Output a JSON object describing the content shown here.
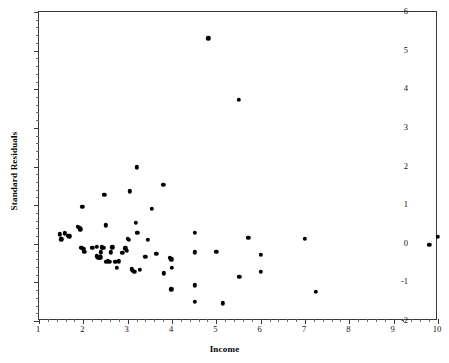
{
  "chart_data": {
    "type": "scatter",
    "title": "",
    "xlabel": "Income",
    "ylabel": "Standard Residuals",
    "xlim": [
      1,
      10
    ],
    "ylim": [
      -2,
      6
    ],
    "xticks": [
      1,
      2,
      3,
      4,
      5,
      6,
      7,
      8,
      9,
      10
    ],
    "yticks": [
      -2,
      -1,
      0,
      1,
      2,
      3,
      4,
      5,
      6
    ],
    "x_minor_step": 0.2,
    "y_minor_step": 0.2,
    "grid": false,
    "legend": null,
    "marker": "filled-circle",
    "marker_color": "#000000",
    "points": [
      {
        "x": 1.47,
        "y": 0.24
      },
      {
        "x": 1.5,
        "y": 0.12
      },
      {
        "x": 1.58,
        "y": 0.27
      },
      {
        "x": 1.65,
        "y": 0.2
      },
      {
        "x": 1.68,
        "y": 0.19
      },
      {
        "x": 1.88,
        "y": 0.44
      },
      {
        "x": 1.92,
        "y": 0.42
      },
      {
        "x": 1.93,
        "y": 0.37
      },
      {
        "x": 1.98,
        "y": 0.96
      },
      {
        "x": 1.95,
        "y": -0.1
      },
      {
        "x": 2.0,
        "y": -0.13
      },
      {
        "x": 2.02,
        "y": -0.21
      },
      {
        "x": 2.2,
        "y": -0.1
      },
      {
        "x": 2.3,
        "y": -0.08
      },
      {
        "x": 2.3,
        "y": -0.33
      },
      {
        "x": 2.33,
        "y": -0.36
      },
      {
        "x": 2.36,
        "y": -0.37
      },
      {
        "x": 2.38,
        "y": -0.35
      },
      {
        "x": 2.4,
        "y": -0.22
      },
      {
        "x": 2.42,
        "y": -0.09
      },
      {
        "x": 2.45,
        "y": -0.11
      },
      {
        "x": 2.47,
        "y": 1.27
      },
      {
        "x": 2.5,
        "y": 0.48
      },
      {
        "x": 2.5,
        "y": -0.46
      },
      {
        "x": 2.55,
        "y": -0.45
      },
      {
        "x": 2.6,
        "y": -0.46
      },
      {
        "x": 2.62,
        "y": -0.22
      },
      {
        "x": 2.65,
        "y": -0.09
      },
      {
        "x": 2.72,
        "y": -0.47
      },
      {
        "x": 2.75,
        "y": -0.63
      },
      {
        "x": 2.8,
        "y": -0.45
      },
      {
        "x": 2.88,
        "y": -0.23
      },
      {
        "x": 2.95,
        "y": -0.12
      },
      {
        "x": 2.98,
        "y": -0.18
      },
      {
        "x": 3.0,
        "y": 0.13
      },
      {
        "x": 3.02,
        "y": 0.11
      },
      {
        "x": 3.05,
        "y": 1.36
      },
      {
        "x": 3.1,
        "y": -0.66
      },
      {
        "x": 3.12,
        "y": -0.7
      },
      {
        "x": 3.15,
        "y": -0.72
      },
      {
        "x": 3.18,
        "y": 0.55
      },
      {
        "x": 3.2,
        "y": 1.98
      },
      {
        "x": 3.22,
        "y": 0.29
      },
      {
        "x": 3.28,
        "y": -0.68
      },
      {
        "x": 3.4,
        "y": -0.34
      },
      {
        "x": 3.45,
        "y": 0.11
      },
      {
        "x": 3.55,
        "y": 0.9
      },
      {
        "x": 3.65,
        "y": -0.26
      },
      {
        "x": 3.8,
        "y": 1.53
      },
      {
        "x": 3.82,
        "y": -0.77
      },
      {
        "x": 3.95,
        "y": -0.37
      },
      {
        "x": 3.98,
        "y": -0.4
      },
      {
        "x": 3.98,
        "y": -1.18
      },
      {
        "x": 4.0,
        "y": -0.62
      },
      {
        "x": 4.52,
        "y": 0.29
      },
      {
        "x": 4.52,
        "y": -0.22
      },
      {
        "x": 4.52,
        "y": -1.08
      },
      {
        "x": 4.52,
        "y": -1.5
      },
      {
        "x": 4.82,
        "y": 5.32
      },
      {
        "x": 5.0,
        "y": -0.21
      },
      {
        "x": 5.15,
        "y": -1.54
      },
      {
        "x": 5.5,
        "y": 3.72
      },
      {
        "x": 5.52,
        "y": -0.85
      },
      {
        "x": 5.72,
        "y": 0.16
      },
      {
        "x": 6.0,
        "y": -0.29
      },
      {
        "x": 6.0,
        "y": -0.73
      },
      {
        "x": 7.0,
        "y": 0.13
      },
      {
        "x": 7.25,
        "y": -1.25
      },
      {
        "x": 9.8,
        "y": -0.03
      },
      {
        "x": 10.0,
        "y": 0.18
      }
    ]
  }
}
